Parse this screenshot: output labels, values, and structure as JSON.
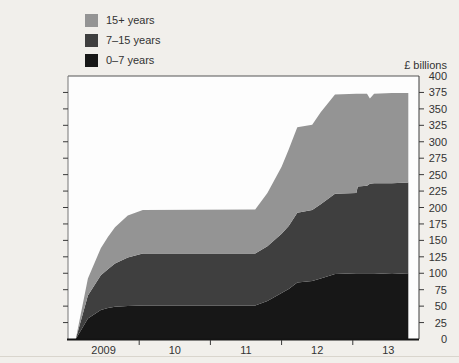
{
  "legend": {
    "items": [
      {
        "label": "15+ years",
        "color": "#949494"
      },
      {
        "label": "7–15 years",
        "color": "#3f3f3f"
      },
      {
        "label": "0–7 years",
        "color": "#171717"
      }
    ]
  },
  "chart_data": {
    "type": "area",
    "stacked": true,
    "title": "",
    "ylabel": "£ billions",
    "xlabel": "",
    "ylim": [
      0,
      400
    ],
    "ytick_step": 25,
    "xlim": [
      2009.0,
      2013.93
    ],
    "grid": false,
    "legend_position": "top-left",
    "x_axis": {
      "tick_years": [
        2010,
        2011,
        2012,
        2013
      ],
      "labels": [
        "2009",
        "10",
        "11",
        "12",
        "13"
      ],
      "label_positions": [
        2009.5,
        2010.5,
        2011.5,
        2012.5,
        2013.5
      ]
    },
    "x": [
      2009.11,
      2009.28,
      2009.46,
      2009.56,
      2009.66,
      2009.84,
      2010.05,
      2011.63,
      2011.8,
      2012.0,
      2012.1,
      2012.22,
      2012.43,
      2012.55,
      2012.75,
      2013.05,
      2013.07,
      2013.2,
      2013.24,
      2013.3,
      2013.55,
      2013.78
    ],
    "series": [
      {
        "name": "0–7 years",
        "color": "#171717",
        "values": [
          0,
          31,
          44,
          47,
          49,
          50,
          51,
          51,
          58,
          70,
          76,
          86,
          88,
          92,
          99,
          100,
          100,
          100,
          100,
          100,
          99,
          100
        ]
      },
      {
        "name": "7–15 years",
        "color": "#3f3f3f",
        "values": [
          0,
          35,
          53,
          59,
          66,
          74,
          79,
          79,
          83,
          90,
          96,
          106,
          108,
          113,
          122,
          122,
          132,
          133,
          136,
          137,
          138,
          138
        ]
      },
      {
        "name": "15+ years",
        "color": "#949494",
        "values": [
          0,
          26,
          41,
          49,
          55,
          64,
          66,
          67,
          81,
          102,
          116,
          130,
          130,
          140,
          151,
          151,
          141,
          140,
          130,
          136,
          137,
          136
        ]
      }
    ],
    "totals_reference": {
      "plateau_2010_11": 197,
      "plateau_mid_2012": 326,
      "end_2013": 374
    }
  },
  "colors": {
    "page_background": "#f1efeb",
    "plot_background": "#fdfdfd",
    "axis": "#3a3a3a",
    "tick_text": "#333333",
    "bottom_rule": "#d9d5cd"
  }
}
